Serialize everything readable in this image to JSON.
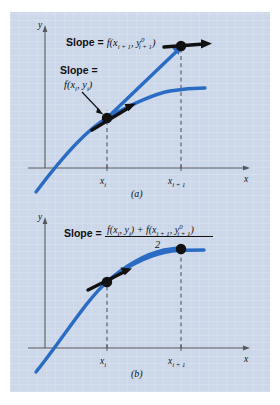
{
  "figure": {
    "background_color": "#ffffff",
    "panel_color": "#ccd8ea",
    "curve_color": "#2a6cc4",
    "accent_color": "#111111",
    "axis_color": "#58595e"
  },
  "panels": [
    {
      "id": "a",
      "label": "(a)",
      "axes": {
        "ylabel": "y",
        "xlabel": "x",
        "ticks": [
          {
            "label_base": "x",
            "label_sub": "i"
          },
          {
            "label_base": "x",
            "label_sub": "i + 1"
          }
        ]
      },
      "annotations": [
        {
          "name": "slope-at-predictor",
          "lines": [
            {
              "bold": "Slope =",
              "func": "f",
              "open": "(",
              "v1_base": "x",
              "v1_sub": "i + 1",
              "sep": ", ",
              "v2_base": "y",
              "v2_sub": "i + 1",
              "v2_sup": "0",
              "close": ")"
            }
          ]
        },
        {
          "name": "slope-at-initial-point",
          "lines": [
            {
              "bold": "Slope ="
            },
            {
              "func": "f",
              "open": "(",
              "v1_base": "x",
              "v1_sub": "i",
              "sep": ", ",
              "v2_base": "y",
              "v2_sub": "i",
              "close": ")"
            }
          ]
        }
      ],
      "points": [
        {
          "name": "point-xi-yi"
        },
        {
          "name": "point-xip1-y0ip1"
        }
      ],
      "curves": [
        {
          "name": "solution-curve"
        },
        {
          "name": "predictor-line"
        }
      ]
    },
    {
      "id": "b",
      "label": "(b)",
      "axes": {
        "ylabel": "y",
        "xlabel": "x",
        "ticks": [
          {
            "label_base": "x",
            "label_sub": "i"
          },
          {
            "label_base": "x",
            "label_sub": "i + 1"
          }
        ]
      },
      "annotations": [
        {
          "name": "slope-average-formula",
          "bold": "Slope =",
          "numerator": {
            "t1_func": "f",
            "t1_open": "(",
            "t1_v1_base": "x",
            "t1_v1_sub": "i",
            "t1_sep": ", ",
            "t1_v2_base": "y",
            "t1_v2_sub": "i",
            "t1_close": ")",
            "plus": " + ",
            "t2_func": "f",
            "t2_open": "(",
            "t2_v1_base": "x",
            "t2_v1_sub": "i + 1",
            "t2_sep": ", ",
            "t2_v2_base": "y",
            "t2_v2_sub": "i + 1",
            "t2_v2_sup": "0",
            "t2_close": ")"
          },
          "denominator": "2"
        }
      ],
      "points": [
        {
          "name": "point-xi-yi"
        },
        {
          "name": "point-xip1-corrected"
        }
      ],
      "curves": [
        {
          "name": "solution-curve"
        },
        {
          "name": "corrector-curve"
        }
      ]
    }
  ]
}
